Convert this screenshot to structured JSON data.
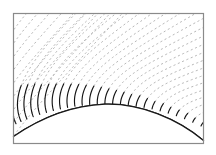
{
  "figure": {
    "title": "",
    "caption": "",
    "background_color": "#ffffff",
    "frame": {
      "name": "plot-frame",
      "x": 13.5,
      "y": 13.5,
      "width": 190,
      "height": 130,
      "stroke_color": "#8a8a8a",
      "stroke_width": 1.2,
      "fill": "none"
    },
    "body_surface": {
      "name": "body-surface-arc",
      "description": "solid black convex body wall arc",
      "stroke_color": "#1a1a1a",
      "stroke_width": 1.3,
      "apex_x": 105,
      "apex_y": 104,
      "left_end_x": 13.5,
      "left_end_y": 136,
      "right_end_x": 203,
      "right_end_y": 140,
      "path": "M 13.5 136.5 C 40 118.5, 72 105.5, 105 104.2 C 140 103.0, 178 119.0, 203.5 140.5"
    },
    "interior_fill": {
      "name": "body-interior",
      "fill": "#ffffff"
    },
    "field_lines": {
      "name": "field-line-family",
      "style": "dashed",
      "dash_pattern": "2.1 2.6",
      "stroke_color": "#a9a9a9",
      "stroke_width": 0.85,
      "count": 26,
      "description": "gray dashed curves fanning out from the body surface toward the upper and right field region"
    },
    "near_wall_lines": {
      "name": "near-wall-solid-segments",
      "style": "solid",
      "stroke_color": "#141414",
      "stroke_width": 1.15,
      "count": 26,
      "description": "solid black initial portions of each field line attached normal to the body surface; long on the left, short ticks on the right"
    },
    "colors": {
      "ink": "#1a1a1a",
      "frame": "#8a8a8a",
      "dash": "#a9a9a9",
      "paper": "#ffffff"
    },
    "geometry": {
      "image_width": 216,
      "image_height": 155,
      "arc_center_x": 106,
      "arc_center_y": 320,
      "arc_radius": 216
    }
  }
}
